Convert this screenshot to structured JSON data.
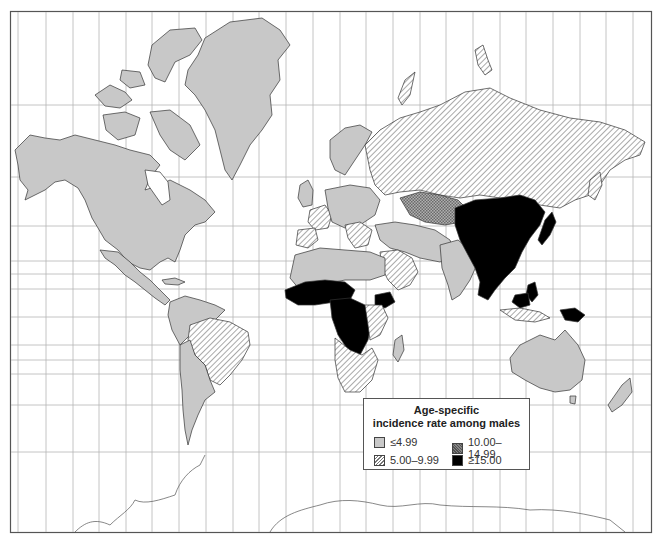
{
  "map": {
    "projection": "Mercator world map",
    "subject": "Age-specific incidence rate among males"
  },
  "legend": {
    "title_line1": "Age-specific",
    "title_line2": "incidence rate among males",
    "items": [
      {
        "label": "≤4.99",
        "pattern": "light-gray-solid",
        "color": "#c8c8c8"
      },
      {
        "label": "10.00–14.99",
        "pattern": "crosshatch-gray",
        "color": "#999999"
      },
      {
        "label": "5.00–9.99",
        "pattern": "diagonal-hatch",
        "color": "#777777"
      },
      {
        "label": "≥15.00",
        "pattern": "solid-black",
        "color": "#000000"
      }
    ]
  },
  "regions": {
    "low": [
      "North America",
      "Greenland",
      "Central America",
      "Northern South America",
      "Southern South America",
      "Northern Europe",
      "North Africa",
      "Middle East",
      "India",
      "Australia",
      "New Zealand",
      "Madagascar"
    ],
    "mid": [
      "Russia",
      "Brazil",
      "France",
      "Spain",
      "Southern Africa",
      "East Africa",
      "Arabian Peninsula",
      "Southeast Europe",
      "Central Asia"
    ],
    "high": [
      "Kazakhstan",
      "Eastern Europe parts"
    ],
    "top": [
      "China",
      "Mongolia",
      "Japan",
      "Korea",
      "Southeast Asia",
      "Philippines",
      "Papua New Guinea",
      "West Africa",
      "Central Africa",
      "Ethiopia"
    ]
  },
  "colors": {
    "low": "#c8c8c8",
    "mid_line": "#777777",
    "high": "#8f8f8f",
    "top": "#000000",
    "grid": "#aaaaaa",
    "frame": "#555555",
    "outline": "#333333"
  }
}
